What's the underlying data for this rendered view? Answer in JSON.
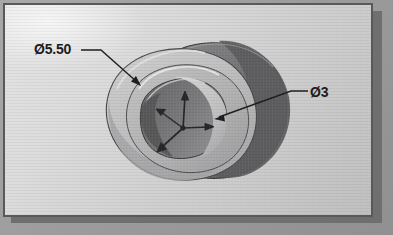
{
  "figure": {
    "kind": "cad-isometric-view",
    "background_color": "#dcdcdc",
    "frame_color": "#59595b",
    "page_color": "#9d9d9d"
  },
  "annotations": {
    "outer_diameter": {
      "name": "outer-diameter-callout",
      "symbol": "Ø",
      "value": "5.50",
      "text": "Ø5.50"
    },
    "bore_diameter": {
      "name": "bore-diameter-callout",
      "symbol": "Ø",
      "value": "3",
      "text": "Ø3"
    }
  },
  "model": {
    "description": "Stepped cylindrical hub with central through bore",
    "surfaces": {
      "rear_disc": "#6e6e70",
      "rear_disc_shadow": "#5c5c5e",
      "front_flange": "#b9b9ba",
      "front_flange_light": "#c8c8c9",
      "bore_wall": "#7c7c7e",
      "bore_floor": "#9a9a9c",
      "highlight_edge": "#e8e8e8",
      "outline": "#3b3b3d"
    }
  },
  "axis_triad": {
    "name": "coordinate-triad",
    "origin_marker": "dot",
    "axes": [
      {
        "id": "y-axis",
        "direction": "up",
        "label": ""
      },
      {
        "id": "x-axis",
        "direction": "right",
        "label": ""
      },
      {
        "id": "z-axis",
        "direction": "down-left",
        "label": ""
      }
    ],
    "color": "#262628"
  }
}
